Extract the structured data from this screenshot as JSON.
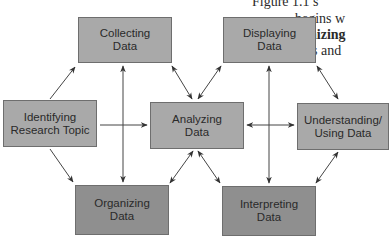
{
  "diagram": {
    "nodes": [
      {
        "id": "collecting",
        "label": "Collecting\nData",
        "shade": "light"
      },
      {
        "id": "displaying",
        "label": "Displaying\nData",
        "shade": "light"
      },
      {
        "id": "identifying",
        "label": "Identifying\nResearch Topic",
        "shade": "light"
      },
      {
        "id": "analyzing",
        "label": "Analyzing\nData",
        "shade": "light"
      },
      {
        "id": "understanding",
        "label": "Understanding/\nUsing Data",
        "shade": "light"
      },
      {
        "id": "organizing",
        "label": "Organizing\nData",
        "shade": "dark"
      },
      {
        "id": "interpreting",
        "label": "Interpreting\nData",
        "shade": "dark"
      }
    ],
    "edges": [
      {
        "from": "identifying",
        "to": "collecting",
        "type": "one-way"
      },
      {
        "from": "identifying",
        "to": "analyzing",
        "type": "one-way"
      },
      {
        "from": "identifying",
        "to": "organizing",
        "type": "one-way"
      },
      {
        "from": "collecting",
        "to": "organizing",
        "type": "two-way"
      },
      {
        "from": "collecting",
        "to": "analyzing",
        "type": "two-way"
      },
      {
        "from": "displaying",
        "to": "analyzing",
        "type": "two-way"
      },
      {
        "from": "displaying",
        "to": "interpreting",
        "type": "two-way"
      },
      {
        "from": "displaying",
        "to": "understanding",
        "type": "two-way"
      },
      {
        "from": "analyzing",
        "to": "understanding",
        "type": "two-way"
      },
      {
        "from": "analyzing",
        "to": "organizing",
        "type": "two-way"
      },
      {
        "from": "analyzing",
        "to": "interpreting",
        "type": "two-way"
      },
      {
        "from": "understanding",
        "to": "interpreting",
        "type": "two-way"
      }
    ],
    "colors": {
      "box_light": "#a9a9a9",
      "box_dark": "#8f8f8f",
      "arrow": "#333333"
    }
  },
  "page_text": {
    "line1": "Figure 1.1 s",
    "line2": "begins w",
    "line3_bold": "ganizing",
    "line4": "bles and"
  }
}
